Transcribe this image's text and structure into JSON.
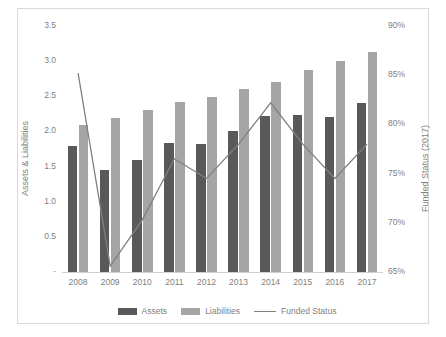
{
  "chart_data": {
    "type": "bar",
    "title": "",
    "xlabel": "",
    "ylabel": "Assets & Liabilities",
    "y2label": "Funded Status (2017)",
    "categories": [
      "2008",
      "2009",
      "2010",
      "2011",
      "2012",
      "2013",
      "2014",
      "2015",
      "2016",
      "2017"
    ],
    "ylim": [
      0,
      3.5
    ],
    "y2lim": [
      65,
      90
    ],
    "grid": false,
    "legend_position": "bottom",
    "yticks": [
      "-",
      "0.5",
      "1.0",
      "1.5",
      "2.0",
      "2.5",
      "3.0",
      "3.5"
    ],
    "y2ticks": [
      "65%",
      "70%",
      "75%",
      "80%",
      "85%",
      "90%"
    ],
    "series": [
      {
        "name": "Assets",
        "type": "bar",
        "axis": "left",
        "color": "#595959",
        "values": [
          1.8,
          1.45,
          1.6,
          1.83,
          1.82,
          2.0,
          2.22,
          2.24,
          2.2,
          2.41
        ]
      },
      {
        "name": "Liabilities",
        "type": "bar",
        "axis": "left",
        "color": "#a5a5a5",
        "values": [
          2.09,
          2.19,
          2.3,
          2.42,
          2.49,
          2.6,
          2.71,
          2.87,
          3.0,
          3.13
        ]
      },
      {
        "name": "Funded Status",
        "type": "line",
        "axis": "right",
        "color": "#808080",
        "values": [
          85.2,
          65.6,
          70.3,
          76.5,
          74.5,
          78.0,
          82.2,
          78.0,
          74.5,
          78.0
        ]
      }
    ]
  },
  "legend": {
    "items": [
      {
        "label": "Assets",
        "marker": "assets-swatch"
      },
      {
        "label": "Liabilities",
        "marker": "liabilities-swatch"
      },
      {
        "label": "Funded Status",
        "marker": "funded-status-line-swatch"
      }
    ]
  }
}
